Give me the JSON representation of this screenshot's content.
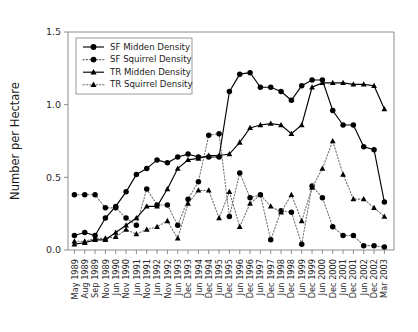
{
  "chart_data": {
    "type": "line",
    "title": "",
    "xlabel": "",
    "ylabel": "Number per Hectare",
    "ylim": [
      0.0,
      1.5
    ],
    "yticks": [
      0.0,
      0.5,
      1.0,
      1.5
    ],
    "ytick_labels": [
      "0.0",
      "0.5",
      "1.0",
      "1.5"
    ],
    "grid": false,
    "legend_position": "upper-left-inside",
    "categories": [
      "May 1989",
      "Aug 1989",
      "Sep 1989",
      "Nov 1989",
      "Jun 1990",
      "Nov 1990",
      "Jun 1991",
      "Nov 1991",
      "Jun 1992",
      "Nov 1992",
      "Jun 1993",
      "Dec 1993",
      "Jun 1994",
      "Dec 1994",
      "Jun 1995",
      "Dec 1995",
      "Jun 1996",
      "Dec 1996",
      "Jun 1997",
      "Dec 1997",
      "Jun 1998",
      "Dec 1998",
      "Jun 1999",
      "Dec 1999",
      "Jun 2000",
      "Dec 2000",
      "Jun 2001",
      "Dec 2001",
      "Jun 2002",
      "Dec 2002",
      "Mar 2003"
    ],
    "series": [
      {
        "name": "SF Midden Density",
        "marker": "circle",
        "line": "solid",
        "color": "#000000",
        "values": [
          0.1,
          0.12,
          0.1,
          0.22,
          0.3,
          0.4,
          0.52,
          0.56,
          0.62,
          0.6,
          0.64,
          0.66,
          0.64,
          0.64,
          0.64,
          1.09,
          1.21,
          1.22,
          1.12,
          1.12,
          1.09,
          1.03,
          1.13,
          1.17,
          1.17,
          0.96,
          0.86,
          0.86,
          0.71,
          0.69,
          0.33
        ]
      },
      {
        "name": "SF Squirrel Density",
        "marker": "circle",
        "line": "dotted",
        "color": "#6f6f6f",
        "values": [
          0.38,
          0.38,
          0.38,
          0.29,
          0.29,
          0.22,
          0.17,
          0.42,
          0.31,
          0.31,
          0.17,
          0.35,
          0.47,
          0.79,
          0.8,
          0.23,
          0.53,
          0.36,
          0.38,
          0.07,
          0.27,
          0.26,
          0.04,
          0.44,
          0.36,
          0.16,
          0.1,
          0.1,
          0.03,
          0.03,
          0.02
        ]
      },
      {
        "name": "TR Midden Density",
        "marker": "triangle",
        "line": "solid",
        "color": "#000000",
        "values": [
          0.04,
          0.05,
          0.07,
          0.07,
          0.12,
          0.17,
          0.22,
          0.3,
          0.3,
          0.42,
          0.56,
          0.62,
          0.63,
          0.65,
          0.65,
          0.66,
          0.74,
          0.84,
          0.86,
          0.87,
          0.86,
          0.8,
          0.86,
          1.12,
          1.15,
          1.15,
          1.15,
          1.14,
          1.14,
          1.13,
          0.97
        ]
      },
      {
        "name": "TR Squirrel Density",
        "marker": "triangle",
        "line": "dotted",
        "color": "#6f6f6f",
        "values": [
          0.06,
          0.06,
          0.08,
          0.08,
          0.09,
          0.14,
          0.11,
          0.14,
          0.16,
          0.2,
          0.08,
          0.32,
          0.41,
          0.41,
          0.22,
          0.4,
          0.16,
          0.32,
          0.38,
          0.3,
          0.26,
          0.38,
          0.2,
          0.43,
          0.56,
          0.75,
          0.52,
          0.35,
          0.35,
          0.29,
          0.23
        ]
      }
    ]
  },
  "legend": {
    "entries": [
      {
        "label": "SF Midden Density"
      },
      {
        "label": "SF Squirrel Density"
      },
      {
        "label": "TR Midden Density"
      },
      {
        "label": "TR Squirrel Density"
      }
    ]
  }
}
